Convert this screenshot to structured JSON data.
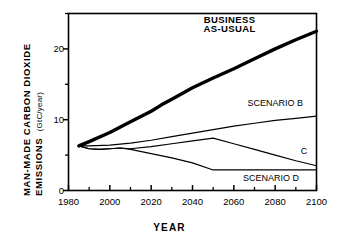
{
  "chart_data": {
    "type": "line",
    "title": "",
    "xlabel": "YEAR",
    "ylabel_line1": "MAN-MADE  CARBON  DIOXIDE",
    "ylabel_line2": "EMISSIONS",
    "ylabel_units": "(GtC/year)",
    "xlim": [
      1980,
      2100
    ],
    "ylim": [
      0,
      25
    ],
    "xticks_major": [
      1980,
      2000,
      2020,
      2040,
      2060,
      2080,
      2100
    ],
    "xticks_minor": [
      1990,
      2010,
      2030,
      2050,
      2070,
      2090
    ],
    "yticks_major": [
      0,
      10,
      20
    ],
    "yticks_minor": [
      5,
      15,
      25
    ],
    "xtick_labels": [
      "1980",
      "2000",
      "2020",
      "2040",
      "2060",
      "2080",
      "2100"
    ],
    "ytick_labels": [
      "0",
      "10",
      "20"
    ],
    "grid": false,
    "legend_position": "inline-annotations",
    "line_color": "#000000",
    "background": "#ffffff",
    "series": [
      {
        "name": "BUSINESS AS-USUAL",
        "label": "BUSINESS\nAS-USUAL",
        "label_line1": "BUSINESS",
        "label_line2": "AS-USUAL",
        "linewidth": "thick",
        "x": [
          1985,
          1990,
          2000,
          2010,
          2020,
          2025,
          2030,
          2040,
          2050,
          2060,
          2070,
          2080,
          2090,
          2100
        ],
        "values": [
          6.3,
          6.9,
          8.2,
          9.7,
          11.2,
          12.1,
          12.9,
          14.5,
          15.9,
          17.2,
          18.6,
          20.0,
          21.3,
          22.5
        ]
      },
      {
        "name": "SCENARIO B",
        "label": "SCENARIO B",
        "linewidth": "thin",
        "x": [
          1985,
          1990,
          2000,
          2010,
          2020,
          2030,
          2040,
          2050,
          2060,
          2070,
          2080,
          2090,
          2100
        ],
        "values": [
          6.3,
          6.3,
          6.4,
          6.7,
          7.1,
          7.6,
          8.1,
          8.6,
          9.1,
          9.5,
          9.9,
          10.2,
          10.5
        ]
      },
      {
        "name": "SCENARIO C",
        "label": "C",
        "linewidth": "thin",
        "x": [
          1985,
          1990,
          1995,
          2000,
          2005,
          2010,
          2020,
          2030,
          2040,
          2050,
          2060,
          2070,
          2080,
          2090,
          2100
        ],
        "values": [
          6.3,
          5.9,
          5.8,
          5.9,
          6.0,
          5.9,
          6.2,
          6.6,
          7.0,
          7.4,
          6.6,
          5.8,
          5.0,
          4.2,
          3.5
        ]
      },
      {
        "name": "SCENARIO D",
        "label": "SCENARIO D",
        "linewidth": "thin",
        "x": [
          1985,
          1990,
          1995,
          2000,
          2005,
          2010,
          2020,
          2030,
          2040,
          2050,
          2060,
          2070,
          2080,
          2090,
          2100
        ],
        "values": [
          6.3,
          5.9,
          5.8,
          5.9,
          6.0,
          5.8,
          5.2,
          4.6,
          3.9,
          2.9,
          2.9,
          2.9,
          2.9,
          2.9,
          2.9
        ]
      }
    ],
    "annotations": [
      {
        "text": "BUSINESS",
        "x": 2058,
        "y": 24.0
      },
      {
        "text": "AS-USUAL",
        "x": 2058,
        "y": 22.6
      },
      {
        "text": "SCENARIO B",
        "x": 2080,
        "y": 12.2
      },
      {
        "text": "C",
        "x": 2094,
        "y": 5.4
      },
      {
        "text": "SCENARIO D",
        "x": 2078,
        "y": 1.6
      }
    ]
  }
}
